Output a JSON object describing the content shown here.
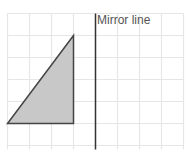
{
  "diagram": {
    "title": "Mirror line",
    "mirror_label": "Mirror line",
    "grid": {
      "columns": 8,
      "rows": 6,
      "cell_size": 22,
      "origin_x": 7,
      "origin_y": 14,
      "line_color": "#e6e6e6"
    },
    "mirror_line": {
      "grid_x": 4,
      "color": "#333333"
    },
    "shape": {
      "type": "right-triangle",
      "vertices_grid": [
        [
          3,
          1
        ],
        [
          0,
          5
        ],
        [
          3,
          5
        ]
      ],
      "fill": "#c8c8c8",
      "stroke": "#444444"
    }
  }
}
